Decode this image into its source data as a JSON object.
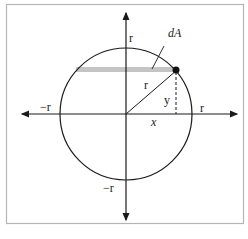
{
  "diagram": {
    "labels": {
      "y_axis_top": "r",
      "y_axis_bottom": "−r",
      "x_axis_left": "−r",
      "x_axis_right": "r",
      "radius": "r",
      "x_coord": "x",
      "y_coord": "y",
      "area_element": "dA"
    },
    "colors": {
      "frame": "#b5b5b5",
      "lines": "#1a1a1a",
      "strip": "#c4c4c4"
    }
  }
}
